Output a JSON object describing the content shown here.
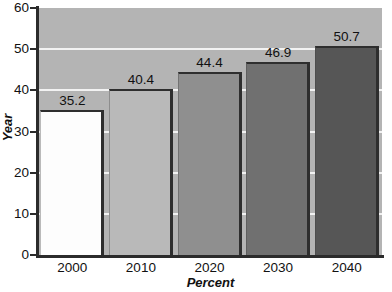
{
  "chart_data": {
    "type": "bar",
    "title": "",
    "xlabel": "Percent",
    "ylabel": "Year",
    "categories": [
      "2000",
      "2010",
      "2020",
      "2030",
      "2040"
    ],
    "values": [
      35.2,
      40.4,
      44.4,
      46.9,
      50.7
    ],
    "value_labels": [
      "35.2",
      "40.4",
      "44.4",
      "46.9",
      "50.7"
    ],
    "ylim": [
      0,
      60
    ],
    "yticks": [
      0,
      10,
      20,
      30,
      40,
      50,
      60
    ],
    "ytick_labels": [
      "0",
      "10",
      "20",
      "30",
      "40",
      "50",
      "60"
    ],
    "grid": true,
    "gridlines_at": [
      10,
      20,
      30,
      40,
      50
    ],
    "legend": "none",
    "plot_background": "#b4b4b4",
    "gridline_color": "#f2f2f2",
    "axis_color": "#2b2b2b",
    "bar_colors": [
      "#fdfdfd",
      "#b9b9b9",
      "#8f8f8f",
      "#707070",
      "#565656"
    ],
    "bar_edge_color": "#2e2e2e"
  }
}
